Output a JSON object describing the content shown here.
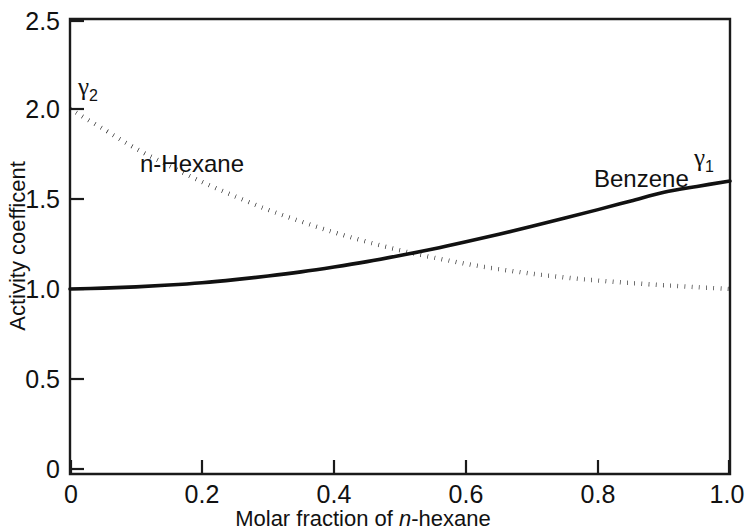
{
  "chart_data": {
    "type": "line",
    "title": "",
    "xlabel": "Molar fraction of n-hexane",
    "ylabel": "Activity coefficent",
    "xlim": [
      0,
      1.0
    ],
    "ylim": [
      0,
      2.5
    ],
    "grid": false,
    "legend": "inline-annotations",
    "x_ticks": [
      "0",
      "0.2",
      "0.4",
      "0.6",
      "0.8",
      "1.0"
    ],
    "x_tick_values": [
      0,
      0.2,
      0.4,
      0.6,
      0.8,
      1.0
    ],
    "y_ticks": [
      "0",
      "0.5",
      "1.0",
      "1.5",
      "2.0",
      "2.5"
    ],
    "y_tick_values": [
      0,
      0.5,
      1.0,
      1.5,
      2.0,
      2.5
    ],
    "x": [
      0,
      0.05,
      0.1,
      0.15,
      0.2,
      0.25,
      0.3,
      0.35,
      0.4,
      0.45,
      0.5,
      0.55,
      0.6,
      0.65,
      0.7,
      0.75,
      0.8,
      0.85,
      0.9,
      0.95,
      1.0
    ],
    "series": [
      {
        "name": "Benzene",
        "symbol": "γ₁",
        "style": "solid",
        "color": "#111111",
        "values": [
          1.0,
          1.005,
          1.012,
          1.022,
          1.035,
          1.052,
          1.072,
          1.095,
          1.122,
          1.152,
          1.186,
          1.222,
          1.262,
          1.304,
          1.348,
          1.394,
          1.441,
          1.489,
          1.537,
          1.57,
          1.6
        ]
      },
      {
        "name": "n-Hexane",
        "symbol": "γ₂",
        "style": "dotted",
        "color": "#111111",
        "values": [
          2.0,
          1.89,
          1.78,
          1.685,
          1.595,
          1.515,
          1.44,
          1.375,
          1.315,
          1.262,
          1.215,
          1.175,
          1.14,
          1.11,
          1.085,
          1.064,
          1.047,
          1.033,
          1.021,
          1.01,
          1.0
        ]
      }
    ],
    "annotations": [
      {
        "text": "γ₂",
        "base": "γ",
        "sub": "2",
        "x_px": 78,
        "y_px": 95
      },
      {
        "text": "n-Hexane",
        "x_px": 140,
        "y_px": 172
      },
      {
        "text": "Benzene",
        "x_px": 594,
        "y_px": 187
      },
      {
        "text": "γ₁",
        "base": "γ",
        "sub": "1",
        "x_px": 694,
        "y_px": 166
      }
    ],
    "crossover": {
      "x": 0.45,
      "y": 1.17
    }
  },
  "axes": {
    "x_label_prefix": "Molar fraction of ",
    "x_label_italic": "n",
    "x_label_suffix": "-hexane",
    "y_label": "Activity coefficent"
  },
  "ticks": {
    "x": [
      "0",
      "0.2",
      "0.4",
      "0.6",
      "0.8",
      "1.0"
    ],
    "y": [
      "0",
      "0.5",
      "1.0",
      "1.5",
      "2.0",
      "2.5"
    ]
  },
  "labels": {
    "hexane": "n-Hexane",
    "benzene": "Benzene",
    "gamma1_base": "γ",
    "gamma1_sub": "1",
    "gamma2_base": "γ",
    "gamma2_sub": "2"
  },
  "colors": {
    "ink": "#111111",
    "background": "#ffffff"
  }
}
